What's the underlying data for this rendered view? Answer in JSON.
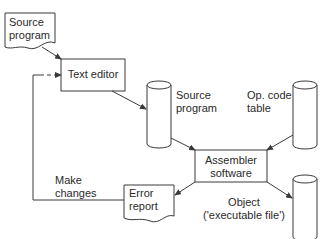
{
  "diagram": {
    "type": "flowchart",
    "nodes": [
      {
        "id": "source_doc",
        "shape": "document",
        "lines": [
          "Source",
          "program"
        ]
      },
      {
        "id": "text_editor",
        "shape": "rectangle",
        "label": "Text editor"
      },
      {
        "id": "source_file",
        "shape": "cylinder",
        "lines": [
          "Source",
          "program"
        ]
      },
      {
        "id": "opcode_table",
        "shape": "cylinder",
        "lines": [
          "Op. code",
          "table"
        ]
      },
      {
        "id": "assembler",
        "shape": "rectangle",
        "lines": [
          "Assembler",
          "software"
        ]
      },
      {
        "id": "error_report",
        "shape": "document",
        "lines": [
          "Error",
          "report"
        ]
      },
      {
        "id": "object_file",
        "shape": "cylinder",
        "lines": [
          "Object",
          "('executable file')"
        ]
      }
    ],
    "edges": [
      {
        "from": "source_doc",
        "to": "text_editor"
      },
      {
        "from": "text_editor",
        "to": "source_file"
      },
      {
        "from": "source_file",
        "to": "assembler"
      },
      {
        "from": "opcode_table",
        "to": "assembler"
      },
      {
        "from": "assembler",
        "to": "error_report"
      },
      {
        "from": "assembler",
        "to": "object_file"
      },
      {
        "from": "error_report",
        "to": "text_editor",
        "label": "Make changes",
        "style": "loop-back, dashed end"
      }
    ],
    "labels": {
      "make_changes": [
        "Make",
        "changes"
      ]
    },
    "colors": {
      "stroke": "#3a3a3a",
      "text": "#2a2a2a",
      "background": "#ffffff"
    }
  }
}
